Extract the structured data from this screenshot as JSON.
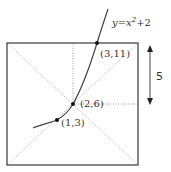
{
  "diagram": {
    "curve_label": {
      "text_y": "y",
      "text_eq": "=x",
      "text_exp": "2",
      "text_tail": "+2"
    },
    "points": [
      {
        "label": "(3,11)",
        "x": 3,
        "y": 11
      },
      {
        "label": "(2,6)",
        "x": 2,
        "y": 6
      },
      {
        "label": "(1,3)",
        "x": 1,
        "y": 3
      }
    ],
    "dimension_label": "5",
    "function": "y = x^2 + 2"
  }
}
